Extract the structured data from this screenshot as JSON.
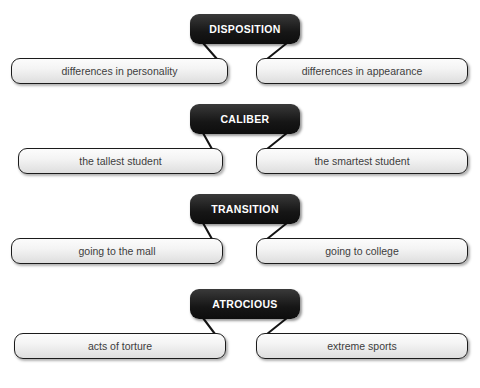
{
  "diagram": {
    "type": "vocabulary-term-example-map",
    "groups": [
      {
        "term": "DISPOSITION",
        "examples": [
          {
            "text": "differences in personality",
            "side": "left"
          },
          {
            "text": "differences in appearance",
            "side": "right"
          }
        ]
      },
      {
        "term": "CALIBER",
        "examples": [
          {
            "text": "the tallest student",
            "side": "left"
          },
          {
            "text": "the smartest student",
            "side": "right"
          }
        ]
      },
      {
        "term": "TRANSITION",
        "examples": [
          {
            "text": "going to the mall",
            "side": "left"
          },
          {
            "text": "going to college",
            "side": "right"
          }
        ]
      },
      {
        "term": "ATROCIOUS",
        "examples": [
          {
            "text": "acts of torture",
            "side": "left"
          },
          {
            "text": "extreme sports",
            "side": "right"
          }
        ]
      }
    ]
  },
  "style": {
    "term_background": "#161616",
    "term_text_color": "#ffffff",
    "example_background": "#f0f0f0",
    "example_border": "#1b1b1b",
    "example_text_color": "#3d3d3d",
    "connector_color": "#141414",
    "page_background": "#ffffff"
  },
  "layout": {
    "groups": [
      {
        "top": 14,
        "box_top": 58,
        "left_box_x": 11,
        "left_box_w": 217,
        "right_box_x": 256,
        "right_box_w": 212
      },
      {
        "top": 104,
        "box_top": 148,
        "left_box_x": 18,
        "left_box_w": 205,
        "right_box_x": 256,
        "right_box_w": 212
      },
      {
        "top": 194,
        "box_top": 238,
        "left_box_x": 11,
        "left_box_w": 212,
        "right_box_x": 256,
        "right_box_w": 212
      },
      {
        "top": 289,
        "box_top": 333,
        "left_box_x": 14,
        "left_box_w": 212,
        "right_box_x": 256,
        "right_box_w": 212
      }
    ]
  }
}
